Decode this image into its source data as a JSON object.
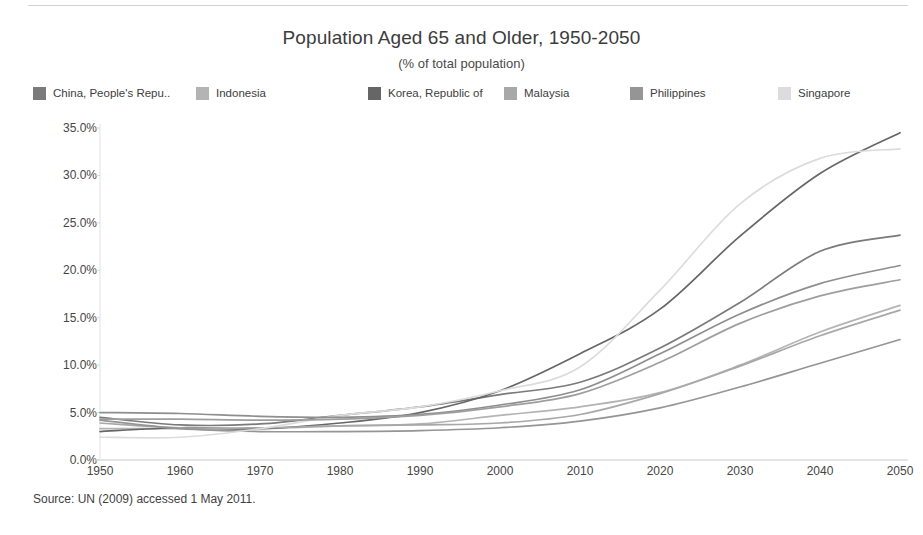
{
  "chart_data": {
    "type": "line",
    "title": "Population Aged 65 and Older, 1950-2050",
    "subtitle": "(% of total population)",
    "xlabel": "",
    "ylabel": "Share of Total Population",
    "xlim": [
      1950,
      2050
    ],
    "ylim": [
      0,
      35
    ],
    "grid": false,
    "legend_position": "top",
    "x": [
      1950,
      1960,
      1970,
      1980,
      1990,
      2000,
      2010,
      2020,
      2030,
      2040,
      2050
    ],
    "xtick_labels": [
      "1950",
      "1960",
      "1970",
      "1980",
      "1990",
      "2000",
      "2010",
      "2020",
      "2030",
      "2040",
      "2050"
    ],
    "ytick_labels": [
      "0.0%",
      "5.0%",
      "10.0%",
      "15.0%",
      "20.0%",
      "25.0%",
      "30.0%",
      "35.0%"
    ],
    "ytick_values": [
      0,
      5,
      10,
      15,
      20,
      25,
      30,
      35
    ],
    "series": [
      {
        "name": "China, People's Repu..",
        "legend_label": "China, People's Repu..",
        "color": "#7a7a7a",
        "values": [
          4.5,
          3.7,
          3.8,
          4.7,
          5.6,
          6.9,
          8.2,
          11.8,
          16.6,
          22.0,
          23.7
        ]
      },
      {
        "name": "Indonesia",
        "legend_label": "Indonesia",
        "color": "#b4b4b4",
        "values": [
          3.3,
          3.3,
          3.3,
          3.6,
          3.8,
          4.7,
          5.6,
          7.1,
          10.0,
          13.5,
          16.3
        ]
      },
      {
        "name": "Korea, Republic of",
        "legend_label": "Korea, Republic of",
        "color": "#666666",
        "values": [
          3.0,
          3.4,
          3.3,
          3.9,
          5.0,
          7.3,
          11.2,
          15.9,
          23.6,
          30.2,
          34.5
        ]
      },
      {
        "name": "Malaysia",
        "legend_label": "Malaysia",
        "color": "#a8a8a8",
        "values": [
          3.9,
          3.4,
          3.4,
          3.6,
          3.7,
          3.9,
          4.8,
          7.0,
          9.9,
          13.1,
          15.8
        ]
      },
      {
        "name": "Philippines",
        "legend_label": "Philippines",
        "color": "#959595",
        "values": [
          4.2,
          3.3,
          3.0,
          3.0,
          3.1,
          3.4,
          4.1,
          5.5,
          7.7,
          10.2,
          12.7
        ]
      },
      {
        "name": "Singapore",
        "legend_label": "Singapore",
        "color": "#dcdcdc",
        "values": [
          2.4,
          2.4,
          3.3,
          4.7,
          5.6,
          7.3,
          9.8,
          17.9,
          27.0,
          31.8,
          32.8
        ]
      },
      {
        "name": "unlabeled-series-a",
        "legend_label": "",
        "color": "#8e8e8e",
        "values": [
          5.0,
          4.9,
          4.6,
          4.5,
          4.8,
          5.8,
          7.4,
          11.2,
          15.4,
          18.6,
          20.5
        ]
      },
      {
        "name": "unlabeled-series-b",
        "legend_label": "",
        "color": "#9e9e9e",
        "values": [
          4.3,
          4.3,
          4.2,
          4.3,
          4.7,
          5.6,
          7.0,
          10.3,
          14.4,
          17.3,
          19.0
        ]
      }
    ]
  },
  "source": {
    "text": "Source: UN (2009) accessed 1 May 2011."
  }
}
